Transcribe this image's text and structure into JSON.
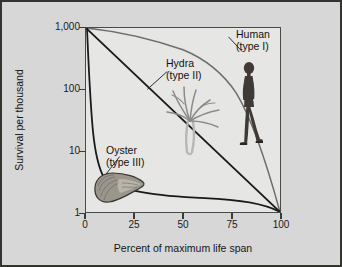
{
  "figure": {
    "background_color": "#d7d7d7",
    "border_color": "#333330",
    "plot_background_color": "#e6e6e4"
  },
  "axes": {
    "y_title": "Survival per thousand",
    "x_title": "Percent of maximum life span",
    "y_tick_labels": [
      "1,000",
      "100",
      "10",
      "1"
    ],
    "x_tick_labels": [
      "0",
      "25",
      "50",
      "75",
      "100"
    ]
  },
  "annotations": {
    "human": {
      "line1": "Human",
      "line2": "(type I)"
    },
    "hydra": {
      "line1": "Hydra",
      "line2": "(type II)"
    },
    "oyster": {
      "line1": "Oyster",
      "line2": "(type III)"
    }
  },
  "illustrations": {
    "human": "human-walking-illustration",
    "hydra": "hydra-illustration",
    "oyster": "oyster-shell-illustration"
  },
  "chart_data": {
    "type": "line",
    "title": "",
    "xlabel": "Percent of maximum life span",
    "ylabel": "Survival per thousand",
    "xlim": [
      0,
      100
    ],
    "ylim": [
      1,
      1000
    ],
    "yscale": "log",
    "grid": false,
    "legend_position": "inline-annotations",
    "xticks": [
      0,
      25,
      50,
      75,
      100
    ],
    "yticks": [
      1,
      10,
      100,
      1000
    ],
    "ytick_labels": [
      "1",
      "10",
      "100",
      "1,000"
    ],
    "series": [
      {
        "name": "Human (type I)",
        "survivorship_type": "I",
        "color": "#6d6d6b",
        "x": [
          0,
          10,
          20,
          30,
          40,
          50,
          60,
          65,
          70,
          75,
          80,
          85,
          90,
          95,
          100
        ],
        "values": [
          1000,
          980,
          960,
          935,
          905,
          870,
          820,
          780,
          720,
          620,
          450,
          230,
          80,
          18,
          1
        ]
      },
      {
        "name": "Hydra (type II)",
        "survivorship_type": "II",
        "color": "#1a1a1a",
        "x": [
          0,
          25,
          50,
          75,
          100
        ],
        "values": [
          1000,
          178,
          31.6,
          5.6,
          1
        ]
      },
      {
        "name": "Oyster (type III)",
        "survivorship_type": "III",
        "color": "#1a1a1a",
        "x": [
          0,
          1,
          2,
          3,
          4,
          5,
          6,
          8,
          10,
          15,
          25,
          40,
          60,
          80,
          100
        ],
        "values": [
          1000,
          300,
          100,
          45,
          26,
          18,
          14,
          10.5,
          9,
          5.5,
          2.6,
          2.2,
          2.0,
          1.7,
          1
        ]
      }
    ]
  }
}
